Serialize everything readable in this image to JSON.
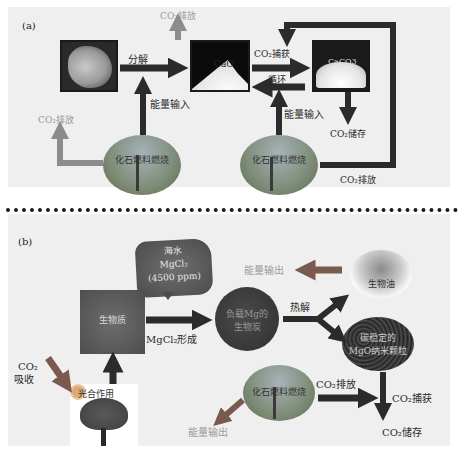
{
  "panel_a": {
    "label": "(a)",
    "nodes": {
      "limestone": {
        "label": ""
      },
      "cao": {
        "label": "CaO"
      },
      "caco3": {
        "label": "CaCO3"
      },
      "fossil_left": {
        "label": "化石燃料燃烧"
      },
      "fossil_right": {
        "label": "化石燃料燃烧"
      }
    },
    "labels": {
      "decompose": "分解",
      "co2_release_top": "CO₂排放",
      "co2_release_left": "CO₂排放",
      "energy_input_left": "能量输入",
      "co2_capture": "CO₂捕获",
      "cycle": "循环",
      "energy_input_right": "能量输入",
      "co2_storage": "CO₂储存",
      "co2_release_right": "CO₂排放"
    }
  },
  "panel_b": {
    "label": "(b)",
    "nodes": {
      "seawater": {
        "line1": "海水",
        "line2": "MgCl₂",
        "line3": "(4500 ppm)"
      },
      "biomass": {
        "label": "生物质"
      },
      "mg_biochar": {
        "line1": "负载Mg的",
        "line2": "生物炭"
      },
      "bio_oil": {
        "label": "生物油"
      },
      "mgo_particles": {
        "line1": "碳稳定的",
        "line2": "MgO纳米颗粒"
      },
      "fossil": {
        "label": "化石燃料燃烧"
      },
      "photosynthesis": {
        "label": "光合作用"
      }
    },
    "labels": {
      "mgcl2_formation": "MgCl₂形成",
      "pyrolysis": "热解",
      "energy_output_top": "能量输出",
      "energy_output_bottom": "能量输出",
      "co2_absorb_line1": "CO₂",
      "co2_absorb_line2": "吸收",
      "co2_release": "CO₂排放",
      "co2_capture": "CO₂捕获",
      "co2_storage": "CO₂储存"
    }
  },
  "colors": {
    "background": "#efefef",
    "arrow_dark": "#2b2b2b",
    "arrow_gray": "#8c8c8c",
    "arrow_red": "#7a5a4e",
    "text_gray": "#9a9a9a",
    "divider": "#1a1a1a"
  }
}
